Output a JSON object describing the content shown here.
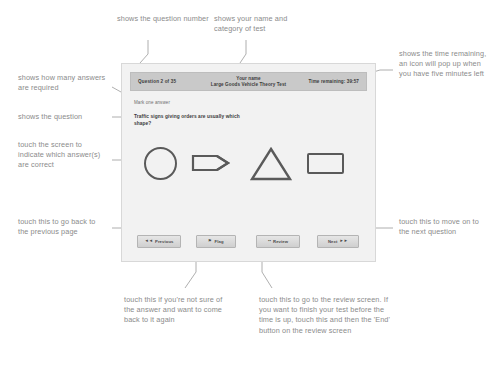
{
  "test_screen": {
    "header": {
      "question_counter": "Question 2 of 35",
      "name_label": "Your name",
      "test_category": "Large Goods Vehicle Theory Test",
      "time_remaining": "Time remaining: 39:57"
    },
    "mark_instruction": "Mark one answer",
    "question_text": "Traffic signs giving orders are usually which shape?",
    "answers": [
      {
        "name": "circle",
        "icon": "circle-shape"
      },
      {
        "name": "arrow",
        "icon": "pennant-arrow-shape"
      },
      {
        "name": "triangle",
        "icon": "triangle-shape"
      },
      {
        "name": "rectangle",
        "icon": "rectangle-shape"
      }
    ],
    "buttons": [
      {
        "label": "Previous",
        "icon": "double-left-arrow-icon",
        "glyph": "◄◄",
        "icon_side": "left"
      },
      {
        "label": "Flag",
        "icon": "flag-icon",
        "glyph": "⚑",
        "icon_side": "left"
      },
      {
        "label": "Review",
        "icon": "review-dots-icon",
        "glyph": "••",
        "icon_side": "left"
      },
      {
        "label": "Next",
        "icon": "double-right-arrow-icon",
        "glyph": "►►",
        "icon_side": "right"
      }
    ]
  },
  "annotations": {
    "question_number": "shows the question number",
    "name_and_category": "shows your name and category of test",
    "time_remaining": "shows the time remaining, an icon will pop up when you have five minutes left",
    "answers_required": "shows how many answers are required",
    "question": "shows the question",
    "touch_screen": "touch the screen to indicate which answer(s) are correct",
    "previous": "touch this to go back to the previous page",
    "next": "touch this to move on to the next question",
    "flag": "touch this if you're not sure of the answer and want to come back to it again",
    "review": "touch this to go to the review screen. If you want to finish your test before the time is up, touch this and then the 'End' button on the review screen"
  },
  "colors": {
    "annotation_text": "#8b8b8b",
    "header_bar": "#c9c9c9",
    "device_bg": "#f2f2f2",
    "shape_stroke": "#5a5a5a",
    "leader_line": "#9a9a9a"
  }
}
